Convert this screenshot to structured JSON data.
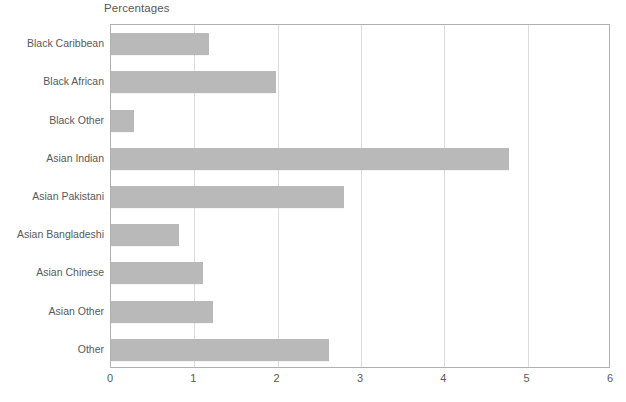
{
  "chart_data": {
    "type": "bar",
    "orientation": "horizontal",
    "title": "Percentages",
    "xlabel": "",
    "ylabel": "",
    "xlim": [
      0,
      6
    ],
    "xticks": [
      0,
      1,
      2,
      3,
      4,
      5,
      6
    ],
    "xtick_labels": [
      "0",
      "1",
      "2",
      "3",
      "4",
      "5",
      "6"
    ],
    "grid": true,
    "grid_axis": "x",
    "legend": false,
    "categories": [
      "Black Caribbean",
      "Black African",
      "Black Other",
      "Asian Indian",
      "Asian Pakistani",
      "Asian Bangladeshi",
      "Asian Chinese",
      "Asian Other",
      "Other"
    ],
    "values": [
      1.18,
      1.98,
      0.28,
      4.78,
      2.8,
      0.82,
      1.1,
      1.22,
      2.62
    ],
    "bar_color": "#b9b9b9",
    "plot_border_color": "#b0b0b0",
    "gridline_color": "#dcdcdc",
    "text_color": "#58595b"
  }
}
